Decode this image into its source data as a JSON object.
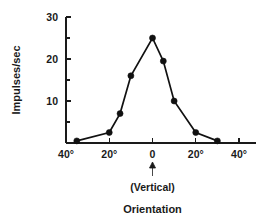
{
  "chart_data": {
    "type": "line",
    "title": "",
    "subtitle": "",
    "xlabel": "Orientation",
    "ylabel": "Impulses/sec",
    "xlim": [
      -45,
      45
    ],
    "ylim": [
      0,
      30
    ],
    "grid": false,
    "legend": "none",
    "x_tick_labels": [
      "40°",
      "20°",
      "0",
      "20°",
      "40°"
    ],
    "x_tick_values": [
      -40,
      -20,
      0,
      20,
      40
    ],
    "x_minor_ticks": [],
    "y_tick_labels": [
      "10",
      "20",
      "30"
    ],
    "y_tick_values": [
      10,
      20,
      30
    ],
    "y_minor_ticks": [
      5,
      15,
      25
    ],
    "annotations": [
      {
        "name": "vertical-marker",
        "text": "(Vertical)",
        "x": 0,
        "arrow": "up"
      }
    ],
    "series": [
      {
        "name": "orientation-tuning",
        "x": [
          -35,
          -20,
          -15,
          -10,
          0,
          5,
          10,
          20,
          30
        ],
        "values": [
          0.5,
          2.5,
          7,
          16,
          25,
          19.5,
          10,
          2.5,
          0.5
        ]
      }
    ]
  },
  "axes": {
    "y_axis_title": "Impulses/sec",
    "x_axis_title": "Orientation",
    "vertical_note": "(Vertical)"
  }
}
